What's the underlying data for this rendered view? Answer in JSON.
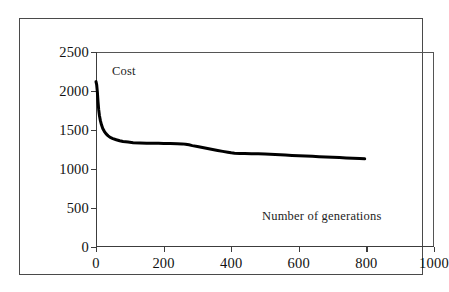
{
  "figure": {
    "series_label": "Cost",
    "xaxis_title": "Number of generations"
  },
  "chart_data": {
    "type": "line",
    "title": "",
    "subtitle": "",
    "xlabel": "Number of generations",
    "ylabel": "Cost",
    "xlim": [
      0,
      1000
    ],
    "ylim": [
      0,
      2500
    ],
    "xticks": [
      0,
      200,
      400,
      600,
      800,
      1000
    ],
    "yticks": [
      0,
      500,
      1000,
      1500,
      2000,
      2500
    ],
    "xtick_labels": [
      "0",
      "200",
      "400",
      "600",
      "800",
      "1000"
    ],
    "ytick_labels": [
      "0",
      "500",
      "1000",
      "1500",
      "2000",
      "2500"
    ],
    "grid": false,
    "legend": null,
    "legend_position": "none",
    "annotations": [
      {
        "text": "Cost",
        "x": 30,
        "y": 2330
      },
      {
        "text": "Number of generations",
        "x": 480,
        "y": 420
      }
    ],
    "series": [
      {
        "name": "Cost",
        "color": "#000000",
        "line_width": 3,
        "x": [
          0,
          2,
          4,
          6,
          8,
          10,
          13,
          16,
          20,
          25,
          30,
          36,
          42,
          50,
          60,
          70,
          80,
          95,
          110,
          130,
          150,
          170,
          185,
          200,
          220,
          240,
          255,
          265,
          275,
          285,
          300,
          315,
          330,
          345,
          360,
          375,
          390,
          400,
          410,
          425,
          440,
          460,
          480,
          500,
          515,
          530,
          545,
          560,
          580,
          600,
          620,
          640,
          660,
          680,
          700,
          720,
          740,
          760,
          780,
          795
        ],
        "y": [
          2120,
          2080,
          1990,
          1860,
          1760,
          1690,
          1620,
          1570,
          1520,
          1480,
          1450,
          1425,
          1405,
          1390,
          1375,
          1362,
          1352,
          1345,
          1338,
          1334,
          1331,
          1330,
          1329,
          1328,
          1326,
          1324,
          1322,
          1318,
          1310,
          1300,
          1288,
          1275,
          1262,
          1250,
          1238,
          1226,
          1215,
          1208,
          1203,
          1200,
          1198,
          1196,
          1194,
          1192,
          1190,
          1186,
          1182,
          1178,
          1174,
          1170,
          1166,
          1162,
          1158,
          1154,
          1150,
          1146,
          1142,
          1138,
          1134,
          1130
        ]
      }
    ]
  }
}
